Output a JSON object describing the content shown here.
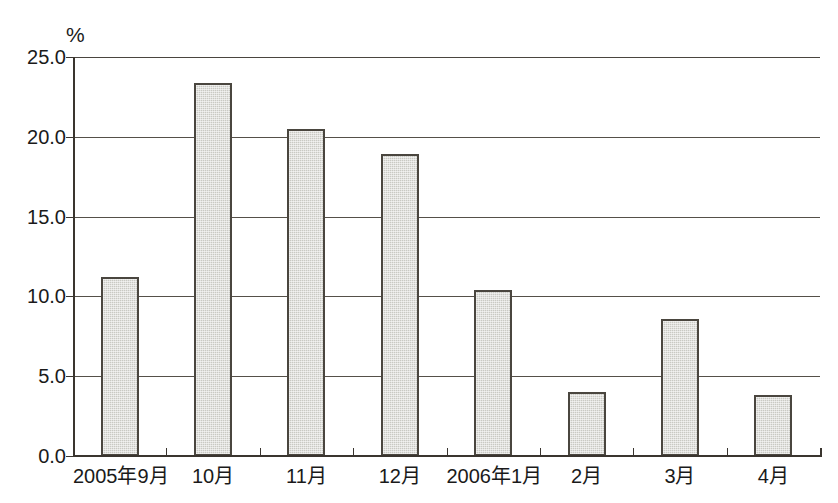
{
  "chart_data": {
    "type": "bar",
    "title": "",
    "subtitle": "",
    "xlabel": "",
    "ylabel": "%",
    "unit_label": "%",
    "categories": [
      "2005年9月",
      "10月",
      "11月",
      "12月",
      "2006年1月",
      "2月",
      "3月",
      "4月"
    ],
    "values": [
      11.2,
      23.4,
      20.5,
      18.9,
      10.4,
      4.0,
      8.6,
      3.8
    ],
    "ylim": [
      0.0,
      25.0
    ],
    "ytick_labels": [
      "0.0",
      "5.0",
      "10.0",
      "15.0",
      "20.0",
      "25.0"
    ],
    "ytick_values": [
      0.0,
      5.0,
      10.0,
      15.0,
      20.0,
      25.0
    ],
    "grid": true,
    "grid_axis": "y",
    "legend": false,
    "legend_position": "none",
    "series": [
      {
        "name": "",
        "values": [
          11.2,
          23.4,
          20.5,
          18.9,
          10.4,
          4.0,
          8.6,
          3.8
        ]
      }
    ],
    "colors": {
      "bar_fill": "#c9c9c3",
      "bar_border": "#4a463f",
      "gridline": "#555049",
      "axis": "#3a352f",
      "text": "#1a1a1a",
      "background": "#ffffff"
    }
  }
}
